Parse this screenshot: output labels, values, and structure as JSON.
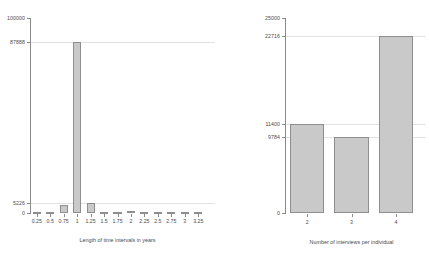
{
  "figure": {
    "background": "#ffffff",
    "bar_fill": "#c9c9c9",
    "bar_stroke": "#8e8e8e",
    "grid_color": "#e2e2e2",
    "axis_color": "#8a8a8a"
  },
  "chart_data": [
    {
      "id": "left",
      "type": "bar",
      "title": "",
      "xlabel": "Length of time intervals in years",
      "ylabel": "",
      "categories": [
        "0.25",
        "0.5",
        "0.75",
        "1",
        "1.25",
        "1.5",
        "1.75",
        "2",
        "2.25",
        "2.5",
        "2.75",
        "3",
        "3.25"
      ],
      "values": [
        600,
        700,
        4200,
        87888,
        5226,
        500,
        450,
        900,
        300,
        280,
        250,
        200,
        180
      ],
      "ylim": [
        0,
        100000
      ],
      "ytick_labels": [
        "0",
        "5226",
        "87888",
        "100000"
      ],
      "ytick_values": [
        0,
        5226,
        87888,
        100000
      ],
      "grid": true,
      "legend": "none"
    },
    {
      "id": "right",
      "type": "bar",
      "title": "",
      "xlabel": "Number of interviews per individual",
      "ylabel": "",
      "categories": [
        "2",
        "3",
        "4"
      ],
      "values": [
        11400,
        9784,
        22716
      ],
      "ylim": [
        0,
        25000
      ],
      "ytick_labels": [
        "0",
        "9784",
        "11400",
        "22716",
        "25000"
      ],
      "ytick_values": [
        0,
        9784,
        11400,
        22716,
        25000
      ],
      "grid": true,
      "legend": "none"
    }
  ]
}
